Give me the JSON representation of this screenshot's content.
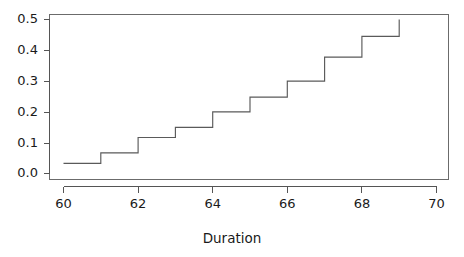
{
  "figure": {
    "background_color": "#ffffff",
    "line_color": "#5a5a5a",
    "axis_color": "#555555",
    "box_color": "#6b6b6b",
    "width": 464,
    "height": 257
  },
  "axes": {
    "x_title": "Duration",
    "y_title": "",
    "x_ticks": [
      "60",
      "62",
      "64",
      "66",
      "68",
      "70"
    ],
    "y_ticks": [
      "0.0",
      "0.1",
      "0.2",
      "0.3",
      "0.4",
      "0.5"
    ]
  },
  "chart_data": {
    "type": "line",
    "title": "",
    "subtitle": "",
    "xlabel": "Duration",
    "ylabel": "",
    "xlim": [
      59.6,
      70.4
    ],
    "ylim": [
      0.0,
      0.52
    ],
    "x_ticks": [
      60,
      62,
      64,
      66,
      68,
      70
    ],
    "y_ticks": [
      0.0,
      0.1,
      0.2,
      0.3,
      0.4,
      0.5
    ],
    "grid": false,
    "legend": "none",
    "drawstyle": "steps-post",
    "series": [
      {
        "name": "Empirical CDF",
        "x": [
          60,
          61,
          62,
          63,
          64,
          65,
          66,
          67,
          68,
          69
        ],
        "values": [
          0.033,
          0.067,
          0.117,
          0.15,
          0.2,
          0.248,
          0.3,
          0.378,
          0.445,
          0.5
        ]
      }
    ],
    "annotations": []
  }
}
